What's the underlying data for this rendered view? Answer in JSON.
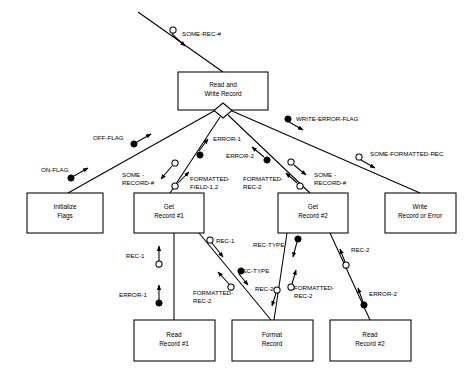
{
  "diagram": {
    "type": "structure-chart",
    "title_text": "",
    "modules": [
      {
        "id": "read_write_record",
        "lines": [
          "Read and",
          "Write Record"
        ],
        "x": 178,
        "y": 72,
        "w": 90,
        "h": 38
      },
      {
        "id": "initialize_flags",
        "lines": [
          "Initialize",
          "Flags"
        ],
        "x": 27,
        "y": 193,
        "w": 76,
        "h": 40
      },
      {
        "id": "get_record_1",
        "lines": [
          "Get",
          "Record #1"
        ],
        "x": 134,
        "y": 193,
        "w": 70,
        "h": 40
      },
      {
        "id": "get_record_2",
        "lines": [
          "Get",
          "Record #2"
        ],
        "x": 278,
        "y": 193,
        "w": 70,
        "h": 40
      },
      {
        "id": "write_record_error",
        "lines": [
          "Write",
          "Record or Error"
        ],
        "x": 385,
        "y": 193,
        "w": 71,
        "h": 40
      },
      {
        "id": "read_record_1",
        "lines": [
          "Read",
          "Record #1"
        ],
        "x": 134,
        "y": 320,
        "w": 81,
        "h": 41
      },
      {
        "id": "read_record_2",
        "lines": [
          "Read",
          "Record #2"
        ],
        "x": 330,
        "y": 320,
        "w": 81,
        "h": 41
      },
      {
        "id": "format_record",
        "lines": [
          "Format",
          "Record"
        ],
        "x": 232,
        "y": 320,
        "w": 81,
        "h": 41
      }
    ],
    "couples": [
      {
        "id": "some-rec-hash",
        "label": "SOME-REC-#",
        "kind": "data",
        "label_x": 182,
        "label_y": 34
      },
      {
        "id": "write-error-flag",
        "label": "WRITE-ERROR-FLAG",
        "kind": "flag",
        "label_x": 296,
        "label_y": 120
      },
      {
        "id": "some-formatted-rec",
        "label": "SOME-FORMATTED-REC",
        "kind": "data",
        "label_x": 371,
        "label_y": 155
      },
      {
        "id": "off-flag",
        "label": "OFF-FLAG",
        "kind": "flag",
        "label_x": 93,
        "label_y": 142
      },
      {
        "id": "on-flag",
        "label": "ON-FLAG",
        "kind": "flag",
        "label_x": 41,
        "label_y": 167
      },
      {
        "id": "error-1-top",
        "label": "ERROR-1",
        "kind": "flag",
        "label_x": 216,
        "label_y": 142
      },
      {
        "id": "error-2-top",
        "label": "ERROR-2",
        "kind": "flag",
        "label_x": 228,
        "label_y": 159
      },
      {
        "id": "some-record-hash-1",
        "label": "SOME -\nRECORD-#",
        "kind": "data",
        "label_x": 124,
        "label_y": 178
      },
      {
        "id": "formatted-field-12",
        "label": "FORMATTED-\nFIELD-1,2",
        "kind": "data",
        "label_x": 190,
        "label_y": 178
      },
      {
        "id": "formatted-rec-2-top",
        "label": "FORMATTED-\nREC-2",
        "kind": "data",
        "label_x": 245,
        "label_y": 180
      },
      {
        "id": "some-record-hash-2",
        "label": "SOME -\nRECORD-#",
        "kind": "data",
        "label_x": 314,
        "label_y": 178
      },
      {
        "id": "rec-1-vert",
        "label": "REC-1",
        "kind": "data",
        "label_x": 127,
        "label_y": 258
      },
      {
        "id": "error-1-vert",
        "label": "ERROR-1",
        "kind": "flag",
        "label_x": 119,
        "label_y": 298
      },
      {
        "id": "rec-1-diag",
        "label": "REC-1",
        "kind": "data",
        "label_x": 216,
        "label_y": 243
      },
      {
        "id": "rec-type-a",
        "label": "REC-TYPE",
        "kind": "flag",
        "label_x": 238,
        "label_y": 273
      },
      {
        "id": "formatted-rec-2-left",
        "label": "FORMATTED-\nREC-2",
        "kind": "data",
        "label_x": 193,
        "label_y": 297
      },
      {
        "id": "rec-type-b",
        "label": "REC-TYPE",
        "kind": "flag",
        "label_x": 253,
        "label_y": 248
      },
      {
        "id": "rec-2-mid",
        "label": "REC-2",
        "kind": "data",
        "label_x": 257,
        "label_y": 292
      },
      {
        "id": "formatted-rec-2-mid",
        "label": "FORMATTED-\nREC-2",
        "kind": "data",
        "label_x": 292,
        "label_y": 292
      },
      {
        "id": "rec-2-right",
        "label": "REC-2",
        "kind": "data",
        "label_x": 351,
        "label_y": 252
      },
      {
        "id": "error-2-right",
        "label": "ERROR-2",
        "kind": "flag",
        "label_x": 369,
        "label_y": 295
      }
    ],
    "colors": {
      "stroke": "#000000",
      "fill": "#ffffff",
      "text": "#000000"
    }
  }
}
